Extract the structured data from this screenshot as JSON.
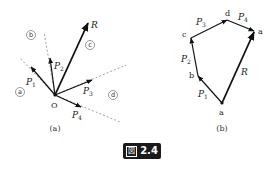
{
  "figure": {
    "label": "図",
    "number": "2.4"
  },
  "panel_a": {
    "caption": "(a)",
    "origin_label": "O",
    "forces": [
      {
        "name": "P",
        "sub": "1"
      },
      {
        "name": "P",
        "sub": "2"
      },
      {
        "name": "P",
        "sub": "3"
      },
      {
        "name": "P",
        "sub": "4"
      }
    ],
    "resultant": "R",
    "regions": [
      "a",
      "b",
      "c",
      "d"
    ]
  },
  "panel_b": {
    "caption": "(b)",
    "vertices": [
      "a",
      "b",
      "c",
      "d",
      "a"
    ],
    "forces": [
      {
        "name": "P",
        "sub": "1"
      },
      {
        "name": "P",
        "sub": "2"
      },
      {
        "name": "P",
        "sub": "3"
      },
      {
        "name": "P",
        "sub": "4"
      }
    ],
    "resultant": "R"
  }
}
